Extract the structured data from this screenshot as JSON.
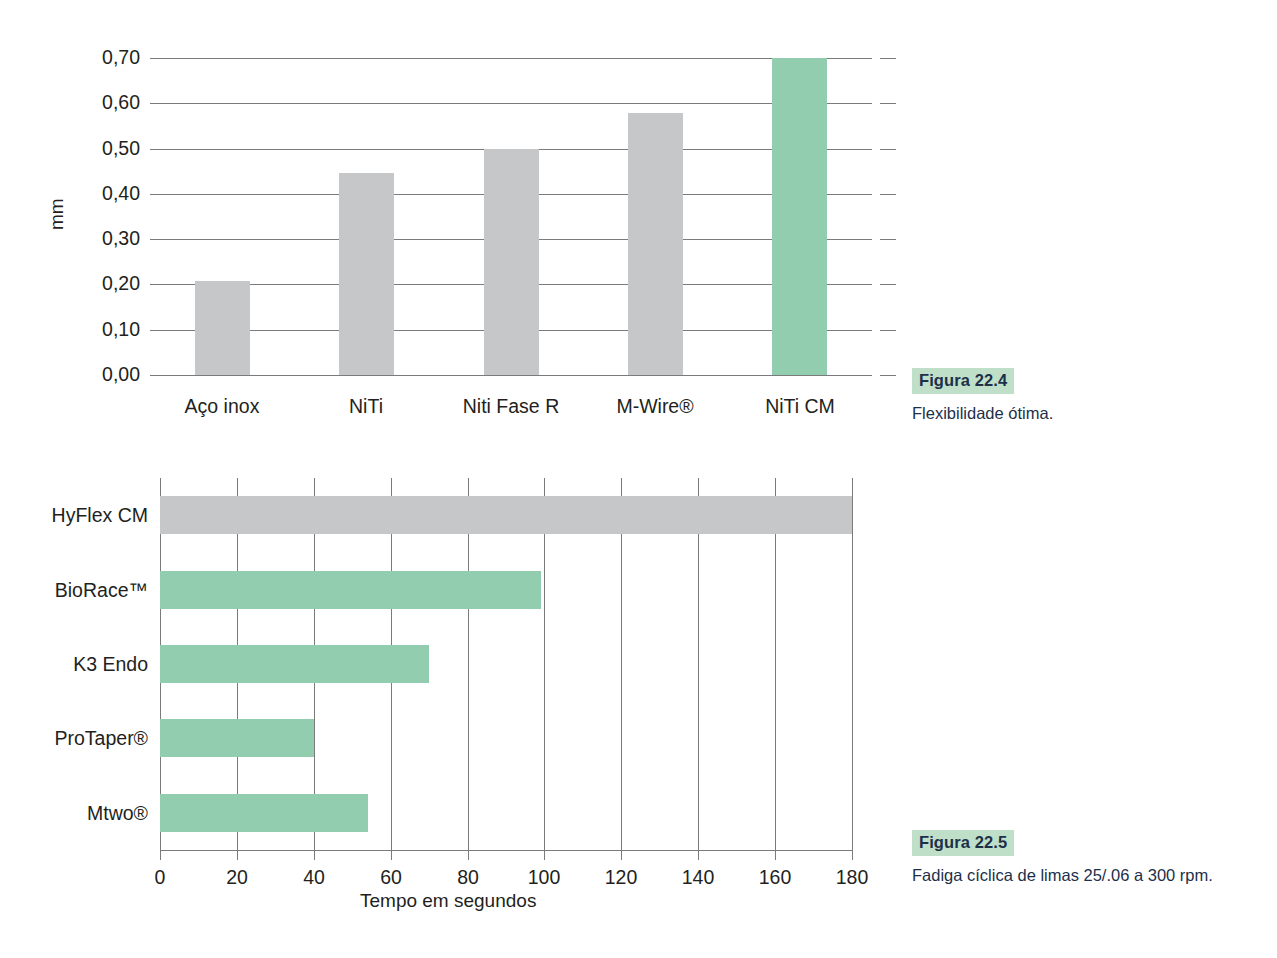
{
  "figure_1": {
    "caption_tag": "Figura 22.4",
    "caption_text": "Flexibilidade ótima."
  },
  "figure_2": {
    "caption_tag": "Figura 22.5",
    "caption_text": "Fadiga cíclica de limas 25/.06 a 300 rpm."
  },
  "colors": {
    "bar_gray": "#c6c7c9",
    "bar_green": "#93cdaf",
    "caption_highlight": "#bfdfc8",
    "caption_text": "#1d3049",
    "grid": "#7b7b7b"
  },
  "chart_data": [
    {
      "type": "bar",
      "orientation": "vertical",
      "title": "",
      "xlabel": "",
      "ylabel": "mm",
      "ylim": [
        0.0,
        0.7
      ],
      "yticks": [
        0.0,
        0.1,
        0.2,
        0.3,
        0.4,
        0.5,
        0.6,
        0.7
      ],
      "ytick_labels": [
        "0,00",
        "0,10",
        "0,20",
        "0,30",
        "0,40",
        "0,50",
        "0,60",
        "0,70"
      ],
      "grid": true,
      "legend": "none",
      "categories": [
        "Aço inox",
        "NiTi",
        "Niti Fase R",
        "M-Wire®",
        "NiTi CM"
      ],
      "values": [
        0.207,
        0.445,
        0.5,
        0.578,
        0.7
      ],
      "bar_colors": [
        "#c6c7c9",
        "#c6c7c9",
        "#c6c7c9",
        "#c6c7c9",
        "#93cdaf"
      ]
    },
    {
      "type": "bar",
      "orientation": "horizontal",
      "title": "",
      "xlabel": "Tempo em segundos",
      "ylabel": "",
      "xlim": [
        0,
        180
      ],
      "xticks": [
        0,
        20,
        40,
        60,
        80,
        100,
        120,
        140,
        160,
        180
      ],
      "xtick_labels": [
        "0",
        "20",
        "40",
        "60",
        "80",
        "100",
        "120",
        "140",
        "160",
        "180"
      ],
      "grid": true,
      "legend": "none",
      "categories": [
        "HyFlex CM",
        "BioRace™",
        "K3 Endo",
        "ProTaper®",
        "Mtwo®"
      ],
      "values": [
        180,
        99,
        70,
        40,
        54
      ],
      "bar_colors": [
        "#c6c7c9",
        "#93cdaf",
        "#93cdaf",
        "#93cdaf",
        "#93cdaf"
      ]
    }
  ]
}
